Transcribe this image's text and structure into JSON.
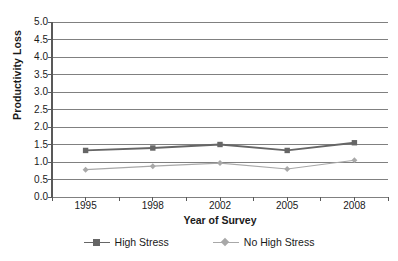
{
  "chart_data": {
    "type": "line",
    "title": "",
    "subtitle": "",
    "xlabel": "Year of Survey",
    "ylabel": "Productivity Loss",
    "categories": [
      "1995",
      "1998",
      "2002",
      "2005",
      "2008"
    ],
    "x_tick_labels": [
      "1995",
      "1998",
      "2002",
      "2005",
      "2008"
    ],
    "y_tick_labels": [
      "0.0",
      "0.5",
      "1.0",
      "1.5",
      "2.0",
      "2.5",
      "3.0",
      "3.5",
      "4.0",
      "4.5",
      "5.0"
    ],
    "y_tick_values": [
      0.0,
      0.5,
      1.0,
      1.5,
      2.0,
      2.5,
      3.0,
      3.5,
      4.0,
      4.5,
      5.0
    ],
    "ylim": [
      0.0,
      5.0
    ],
    "grid": "horizontal",
    "legend_position": "bottom-center",
    "series": [
      {
        "name": "High Stress",
        "values": [
          1.33,
          1.4,
          1.5,
          1.33,
          1.55
        ],
        "color": "#666666",
        "marker": "square"
      },
      {
        "name": "No High Stress",
        "values": [
          0.78,
          0.88,
          0.97,
          0.8,
          1.05
        ],
        "color": "#a8a8a8",
        "marker": "diamond"
      }
    ]
  },
  "style": {
    "background": "#ffffff",
    "gridline_color": "#808080",
    "axis_color": "#595959",
    "text_color": "#1a1a1a"
  }
}
